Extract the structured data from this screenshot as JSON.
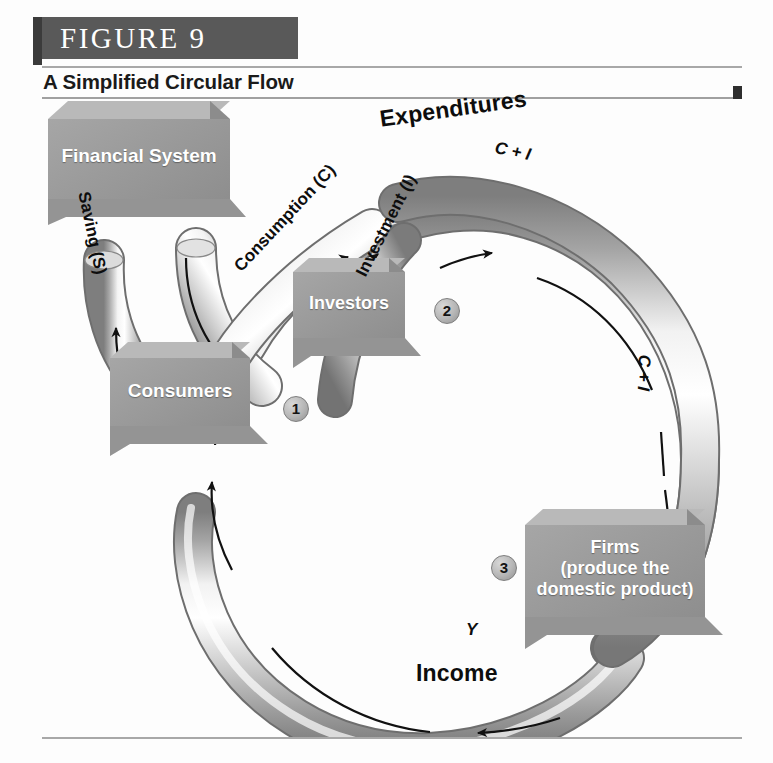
{
  "figure": {
    "number_label": "FIGURE  9",
    "subtitle": "A Simplified Circular Flow"
  },
  "nodes": {
    "financial_system": {
      "label": "Financial System"
    },
    "consumers": {
      "label": "Consumers"
    },
    "investors": {
      "label": "Investors"
    },
    "firms": {
      "line1": "Firms",
      "line2": "(produce the",
      "line3": "domestic product)"
    }
  },
  "steps": [
    {
      "id": "step-1",
      "number": "1"
    },
    {
      "id": "step-2",
      "number": "2"
    },
    {
      "id": "step-3",
      "number": "3"
    }
  ],
  "flow_labels": {
    "expenditures": "Expenditures",
    "income": "Income",
    "saving": "Saving (S)",
    "consumption": "Consumption (C)",
    "investment": "Investment (I)",
    "ci_top": "C + I",
    "ci_right": "C + I",
    "y_bottom": "Y"
  },
  "diagram": {
    "type": "circular-flow",
    "pipes": [
      {
        "name": "saving-pipe",
        "from": "consumers",
        "to": "financial-system",
        "label": "Saving (S)",
        "direction": "up"
      },
      {
        "name": "investment-supply-pipe",
        "from": "financial-system",
        "to": "investors",
        "label": "Investment (I)",
        "direction": "down-right"
      },
      {
        "name": "consumption-pipe",
        "from": "consumers",
        "to": "expenditures-loop",
        "label": "Consumption (C)",
        "direction": "up-right"
      },
      {
        "name": "expenditure-pipe",
        "from": "top-loop",
        "to": "firms",
        "label": "C + I",
        "direction": "clockwise"
      },
      {
        "name": "income-pipe",
        "from": "firms",
        "to": "consumers",
        "label": "Y",
        "direction": "counter-clockwise-bottom"
      }
    ]
  },
  "colors": {
    "header_tab": "#595959",
    "header_accent": "#3b3b3b",
    "box_fill": "#9b9b9b",
    "box_top": "#b4b4b4",
    "box_side": "#8a8a8a",
    "pipe_light": "#ffffff",
    "pipe_mid": "#c9c9c9",
    "pipe_dark": "#7e7e7e",
    "text_dark": "#0d0d0d",
    "text_light": "#ffffff",
    "rule": "#a8a8a8"
  }
}
